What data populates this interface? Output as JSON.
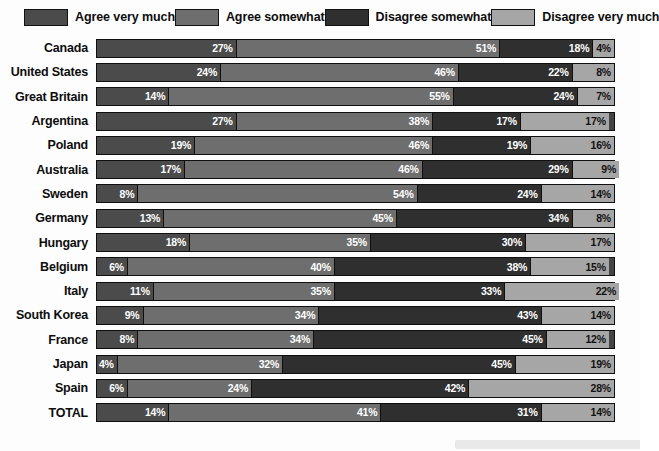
{
  "legend": {
    "items": [
      {
        "label": "Agree very much",
        "color": "#4b4b4b"
      },
      {
        "label": "Agree somewhat",
        "color": "#6e6e6e"
      },
      {
        "label": "Disagree somewhat",
        "color": "#2f2f2f"
      },
      {
        "label": "Disagree very much",
        "color": "#a6a6a6"
      }
    ]
  },
  "chart_data": {
    "type": "bar",
    "orientation": "horizontal",
    "stacked": true,
    "stack_mode": "percent",
    "title": "",
    "subtitle": "",
    "xlabel": "",
    "ylabel": "",
    "xlim": [
      0,
      100
    ],
    "grid": false,
    "legend_position": "top",
    "value_suffix": "%",
    "series": [
      {
        "name": "Agree very much",
        "color": "#4b4b4b",
        "values": [
          27,
          24,
          14,
          27,
          19,
          17,
          8,
          13,
          18,
          6,
          11,
          9,
          8,
          4,
          6,
          14
        ]
      },
      {
        "name": "Agree somewhat",
        "color": "#6e6e6e",
        "values": [
          51,
          46,
          55,
          38,
          46,
          46,
          54,
          45,
          35,
          40,
          35,
          34,
          34,
          32,
          24,
          41
        ]
      },
      {
        "name": "Disagree somewhat",
        "color": "#2f2f2f",
        "values": [
          18,
          22,
          24,
          17,
          19,
          29,
          24,
          34,
          30,
          38,
          33,
          43,
          45,
          45,
          42,
          31
        ]
      },
      {
        "name": "Disagree very much",
        "color": "#a6a6a6",
        "values": [
          4,
          8,
          7,
          17,
          16,
          9,
          14,
          8,
          17,
          15,
          22,
          14,
          12,
          19,
          28,
          14
        ]
      }
    ],
    "categories": [
      "Canada",
      "United States",
      "Great Britain",
      "Argentina",
      "Poland",
      "Australia",
      "Sweden",
      "Germany",
      "Hungary",
      "Belgium",
      "Italy",
      "South Korea",
      "France",
      "Japan",
      "Spain",
      "TOTAL"
    ]
  },
  "rows": [
    {
      "label": "Canada",
      "segments": [
        {
          "value": "27%"
        },
        {
          "value": "51%"
        },
        {
          "value": "18%"
        },
        {
          "value": "4%"
        }
      ]
    },
    {
      "label": "United States",
      "segments": [
        {
          "value": "24%"
        },
        {
          "value": "46%"
        },
        {
          "value": "22%"
        },
        {
          "value": "8%"
        }
      ]
    },
    {
      "label": "Great Britain",
      "segments": [
        {
          "value": "14%"
        },
        {
          "value": "55%"
        },
        {
          "value": "24%"
        },
        {
          "value": "7%"
        }
      ]
    },
    {
      "label": "Argentina",
      "segments": [
        {
          "value": "27%"
        },
        {
          "value": "38%"
        },
        {
          "value": "17%"
        },
        {
          "value": "17%"
        }
      ]
    },
    {
      "label": "Poland",
      "segments": [
        {
          "value": "19%"
        },
        {
          "value": "46%"
        },
        {
          "value": "19%"
        },
        {
          "value": "16%"
        }
      ]
    },
    {
      "label": "Australia",
      "segments": [
        {
          "value": "17%"
        },
        {
          "value": "46%"
        },
        {
          "value": "29%"
        },
        {
          "value": "9%"
        }
      ]
    },
    {
      "label": "Sweden",
      "segments": [
        {
          "value": "8%"
        },
        {
          "value": "54%"
        },
        {
          "value": "24%"
        },
        {
          "value": "14%"
        }
      ]
    },
    {
      "label": "Germany",
      "segments": [
        {
          "value": "13%"
        },
        {
          "value": "45%"
        },
        {
          "value": "34%"
        },
        {
          "value": "8%"
        }
      ]
    },
    {
      "label": "Hungary",
      "segments": [
        {
          "value": "18%"
        },
        {
          "value": "35%"
        },
        {
          "value": "30%"
        },
        {
          "value": "17%"
        }
      ]
    },
    {
      "label": "Belgium",
      "segments": [
        {
          "value": "6%"
        },
        {
          "value": "40%"
        },
        {
          "value": "38%"
        },
        {
          "value": "15%"
        }
      ]
    },
    {
      "label": "Italy",
      "segments": [
        {
          "value": "11%"
        },
        {
          "value": "35%"
        },
        {
          "value": "33%"
        },
        {
          "value": "22%"
        }
      ]
    },
    {
      "label": "South Korea",
      "segments": [
        {
          "value": "9%"
        },
        {
          "value": "34%"
        },
        {
          "value": "43%"
        },
        {
          "value": "14%"
        }
      ]
    },
    {
      "label": "France",
      "segments": [
        {
          "value": "8%"
        },
        {
          "value": "34%"
        },
        {
          "value": "45%"
        },
        {
          "value": "12%"
        }
      ]
    },
    {
      "label": "Japan",
      "segments": [
        {
          "value": "4%"
        },
        {
          "value": "32%"
        },
        {
          "value": "45%"
        },
        {
          "value": "19%"
        }
      ]
    },
    {
      "label": "Spain",
      "segments": [
        {
          "value": "6%"
        },
        {
          "value": "24%"
        },
        {
          "value": "42%"
        },
        {
          "value": "28%"
        }
      ]
    },
    {
      "label": "TOTAL",
      "segments": [
        {
          "value": "14%"
        },
        {
          "value": "41%"
        },
        {
          "value": "31%"
        },
        {
          "value": "14%"
        }
      ]
    }
  ]
}
